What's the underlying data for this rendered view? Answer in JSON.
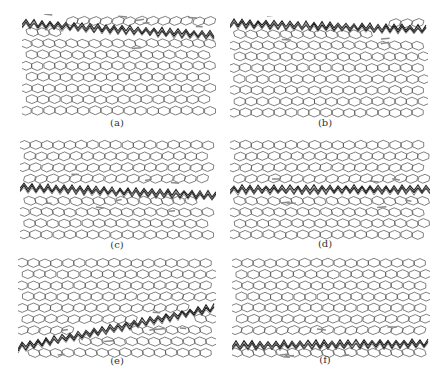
{
  "figure": {
    "panels": [
      {
        "id": "a",
        "label": "(a)",
        "x": 22,
        "y": 14,
        "w": 194,
        "h": 106,
        "crack_y": [
          10,
          22
        ],
        "crack_shape": "top",
        "label_x": 97,
        "label_y": 117
      },
      {
        "id": "b",
        "label": "(b)",
        "x": 230,
        "y": 16,
        "w": 198,
        "h": 102,
        "crack_y": [
          8,
          14
        ],
        "crack_shape": "top",
        "label_x": 305,
        "label_y": 117
      },
      {
        "id": "c",
        "label": "(c)",
        "x": 20,
        "y": 138,
        "w": 196,
        "h": 108,
        "crack_y": [
          50,
          58
        ],
        "crack_shape": "middle",
        "label_x": 97,
        "label_y": 239
      },
      {
        "id": "d",
        "label": "(d)",
        "x": 230,
        "y": 138,
        "w": 200,
        "h": 104,
        "crack_y": [
          52,
          52
        ],
        "crack_shape": "middle",
        "label_x": 305,
        "label_y": 238
      },
      {
        "id": "e",
        "label": "(e)",
        "x": 18,
        "y": 256,
        "w": 198,
        "h": 108,
        "crack_y": [
          92,
          52
        ],
        "crack_shape": "diagonal",
        "label_x": 97,
        "label_y": 355
      },
      {
        "id": "f",
        "label": "(f)",
        "x": 232,
        "y": 256,
        "w": 198,
        "h": 102,
        "crack_y": [
          90,
          88
        ],
        "crack_shape": "bottom",
        "label_x": 305,
        "label_y": 354
      }
    ],
    "colors": {
      "lattice": "#4a4a4a",
      "crack_dark": "#1a1a1a",
      "crack_mid": "#6a6a6a",
      "debris": "#8a8a8a",
      "label": "#333333"
    }
  }
}
